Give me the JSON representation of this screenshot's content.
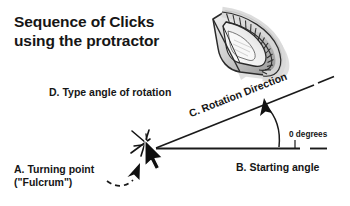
{
  "canvas": {
    "width": 350,
    "height": 206,
    "background": "#ffffff",
    "ink": "#161616"
  },
  "title": {
    "text": "Sequence of Clicks\nusing the protractor"
  },
  "labels": {
    "d": "D. Type angle of rotation",
    "a": "A. Turning point\n(\"Fulcrum\")",
    "b": "B. Starting angle",
    "c": "C. Rotation Direction",
    "zero": "0 degrees"
  },
  "icons": {
    "protractor": "protractor-icon",
    "cursor": "mouse-cursor-icon",
    "click_burst": "click-starburst-icon",
    "fulcrum_pointer": "dashed-curved-arrow-icon",
    "rotation_arrow": "curved-rotation-arrow-icon"
  },
  "diagram": {
    "type": "angle-rotation-diagram",
    "vertex": {
      "x": 156,
      "y": 148
    },
    "baseline": {
      "x1": 156,
      "y1": 148,
      "x2": 300,
      "y2": 148,
      "label": "B. Starting angle"
    },
    "baseline_dash": {
      "x1": 310,
      "y1": 148,
      "x2": 327,
      "y2": 148
    },
    "ray": {
      "x1": 156,
      "y1": 148,
      "x2": 331,
      "y2": 78,
      "label": "C. Rotation Direction"
    },
    "ray_dash": {
      "x1": 316,
      "y1": 84,
      "x2": 333,
      "y2": 77
    },
    "angle_degrees": 0,
    "angle_label": "0 degrees"
  },
  "colors": {
    "ink": "#161616",
    "line": "#1a1a1a",
    "protractor_light": "#e8e8e8",
    "protractor_mid": "#b8b8b8",
    "protractor_dark": "#6e6e6e",
    "shadow": "#b5b5b5"
  }
}
